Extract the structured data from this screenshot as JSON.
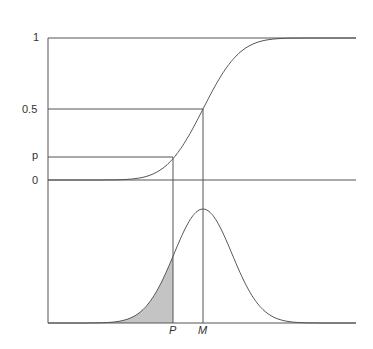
{
  "diagram": {
    "y_labels": {
      "one": "1",
      "half": "0.5",
      "p": "p",
      "zero": "0"
    },
    "x_labels": {
      "P": "P",
      "M": "M"
    },
    "colors": {
      "line": "#444444",
      "shade": "#bdbdbd"
    }
  },
  "chart_data": {
    "type": "line",
    "upper_axis_ticks": [
      "0",
      "p",
      "0.5",
      "1"
    ],
    "lower_axis_ticks": [
      "P",
      "M"
    ]
  }
}
